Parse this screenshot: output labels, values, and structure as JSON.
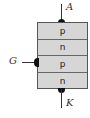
{
  "diagram": {
    "title": "",
    "type": "thyristor-pnpn-structure",
    "layers": [
      {
        "label": "p",
        "color": "#d6d6d6"
      },
      {
        "label": "n",
        "color": "#d6d6d6"
      },
      {
        "label": "p",
        "color": "#d6d6d6"
      },
      {
        "label": "n",
        "color": "#d6d6d6"
      }
    ],
    "terminals": {
      "anode": "A",
      "gate": "G",
      "cathode": "K"
    }
  }
}
